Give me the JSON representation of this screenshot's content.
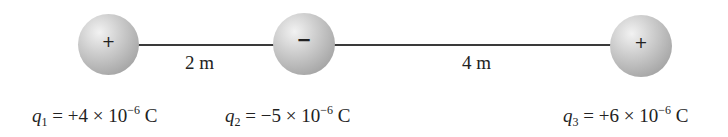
{
  "diagram": {
    "charges": [
      {
        "name": "q1",
        "sign": "+",
        "symbol": "q",
        "subscript": "1",
        "eq": " = +4 × 10",
        "exp": "−6",
        "unit": " C"
      },
      {
        "name": "q2",
        "sign": "−",
        "symbol": "q",
        "subscript": "2",
        "eq": " = −5 × 10",
        "exp": "−6",
        "unit": " C"
      },
      {
        "name": "q3",
        "sign": "+",
        "symbol": "q",
        "subscript": "3",
        "eq": " = +6 × 10",
        "exp": "−6",
        "unit": " C"
      }
    ],
    "distances": [
      {
        "label": "2 m"
      },
      {
        "label": "4 m"
      }
    ],
    "colors": {
      "line": "#3a3a3a",
      "sphere": "#b5b5b5"
    }
  }
}
